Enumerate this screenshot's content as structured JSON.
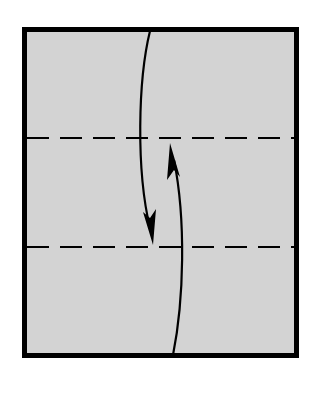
{
  "diagram": {
    "type": "origami-fold-diagram",
    "colors": {
      "background": "#ffffff",
      "paper_fill": "#d3d3d3",
      "border": "#000000",
      "lines": "#000000"
    },
    "sheet": {
      "x": 22,
      "y": 27,
      "width": 277,
      "height": 331,
      "border_width": 5
    },
    "fold_lines": [
      {
        "name": "upper-fold-line",
        "style": "dashed",
        "y": 138
      },
      {
        "name": "lower-fold-line",
        "style": "dashed",
        "y": 247
      }
    ],
    "arrows": [
      {
        "name": "fold-down-arrow",
        "direction": "down",
        "from": [
          150,
          30
        ],
        "to": [
          153,
          244
        ]
      },
      {
        "name": "fold-up-arrow",
        "direction": "up",
        "from": [
          173,
          356
        ],
        "to": [
          170,
          143
        ]
      }
    ]
  }
}
